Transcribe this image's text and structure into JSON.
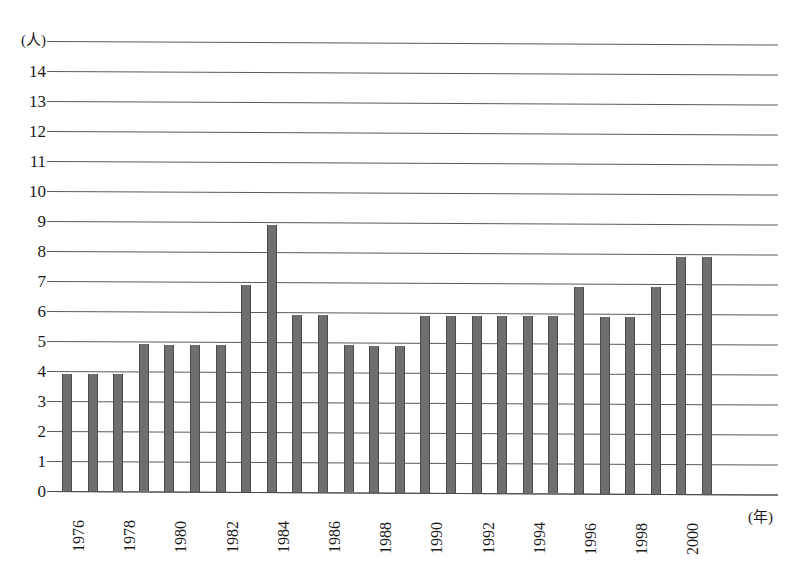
{
  "chart_data": {
    "type": "bar",
    "title": "",
    "subtitle": "",
    "xlabel": "(年)",
    "ylabel": "(人)",
    "categories": [
      "1976",
      "1977",
      "1978",
      "1979",
      "1980",
      "1981",
      "1982",
      "1983",
      "1984",
      "1985",
      "1986",
      "1987",
      "1988",
      "1989",
      "1990",
      "1991",
      "1992",
      "1993",
      "1994",
      "1995",
      "1996",
      "1997",
      "1998",
      "1999",
      "2000",
      "2001"
    ],
    "values": [
      4,
      4,
      4,
      5,
      5,
      5,
      5,
      7,
      9,
      6,
      6,
      5,
      5,
      5,
      6,
      6,
      6,
      6,
      6,
      6,
      7,
      6,
      6,
      7,
      8,
      8
    ],
    "ylim": [
      0,
      15
    ],
    "ytick_labels": [
      "(人)",
      "14",
      "13",
      "12",
      "11",
      "10",
      "9",
      "8",
      "7",
      "6",
      "5",
      "4",
      "3",
      "2",
      "1",
      "0"
    ],
    "ytick_values": [
      15,
      14,
      13,
      12,
      11,
      10,
      9,
      8,
      7,
      6,
      5,
      4,
      3,
      2,
      1,
      0
    ],
    "xtick_labels": [
      "1976",
      "1978",
      "1980",
      "1982",
      "1984",
      "1986",
      "1988",
      "1990",
      "1992",
      "1994",
      "1996",
      "1998",
      "2000"
    ],
    "grid": "horizontal",
    "legend": "none",
    "colors": {
      "bar_fill": "#6f6f6f",
      "bar_edge": "#4a4a4a",
      "gridline": "#5a5a5a",
      "background": "#ffffff",
      "text": "#1a1a1a"
    }
  }
}
